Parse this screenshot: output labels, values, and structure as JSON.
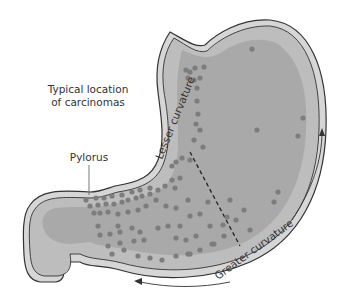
{
  "figure": {
    "title": "Typical location of carcinomas",
    "labels": {
      "typical_line1": "Typical location",
      "typical_line2": "of carcinomas",
      "pylorus": "Pylorus",
      "lesser_curvature": "Lesser curvature",
      "greater_curvature": "Greater curvature"
    },
    "colors": {
      "wall_outer": "#d6d6d6",
      "mucosa": "#bdbdbd",
      "inner": "#a9a9a9",
      "dot": "#7d7d7d",
      "line": "#333333"
    }
  }
}
